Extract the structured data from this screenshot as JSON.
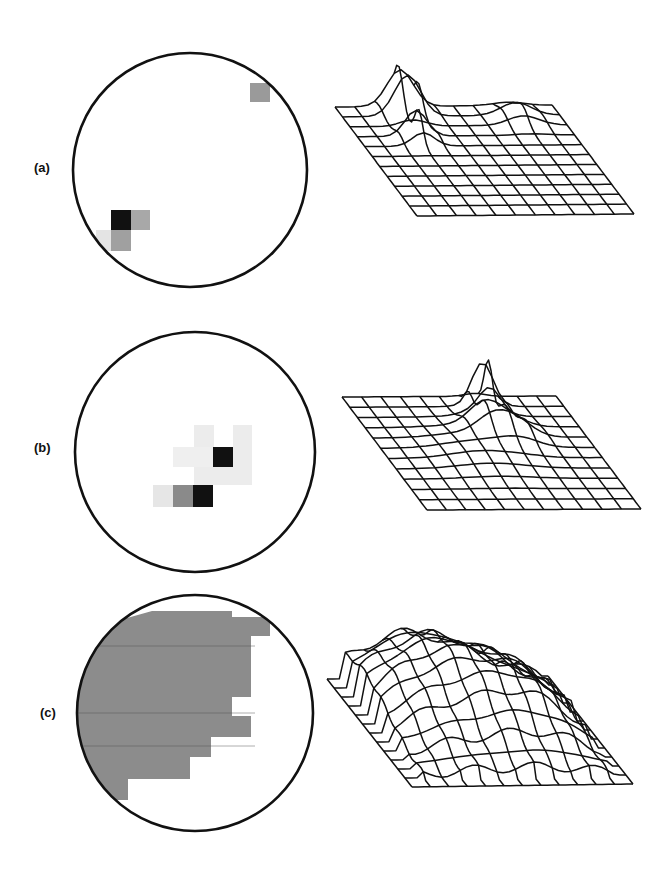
{
  "figure": {
    "panels": [
      {
        "id": "a",
        "label": "(a)",
        "pixel_map": {
          "shape": "circle",
          "cx": 190,
          "cy": 170,
          "r": 117,
          "cells": [
            {
              "x": 250,
              "y": 83,
              "w": 20,
              "h": 19,
              "color": "#9a9a9a"
            },
            {
              "x": 111,
              "y": 210,
              "w": 20,
              "h": 20,
              "color": "#111111"
            },
            {
              "x": 131,
              "y": 210,
              "w": 19,
              "h": 20,
              "color": "#a8a8a8"
            },
            {
              "x": 111,
              "y": 230,
              "w": 20,
              "h": 21,
              "color": "#a0a0a0"
            },
            {
              "x": 96,
              "y": 230,
              "w": 15,
              "h": 21,
              "color": "#e4e4e4"
            }
          ]
        },
        "surface": {
          "description": "flat grid with single sharp peak near left-back and small bump at right-back",
          "grid": {
            "tl": [
              335,
              107
            ],
            "tr": [
              552,
              105
            ],
            "bl": [
              417,
              216
            ],
            "br": [
              632,
              213
            ],
            "cols": 11,
            "rows": 11
          },
          "peaks": [
            {
              "u": 0.3,
              "v": 0.05,
              "height": 52,
              "width": 0.06
            },
            {
              "u": 0.27,
              "v": 0.3,
              "height": 30,
              "width": 0.05
            },
            {
              "u": 0.8,
              "v": 0.12,
              "height": 14,
              "width": 0.07
            }
          ]
        }
      },
      {
        "id": "b",
        "label": "(b)",
        "pixel_map": {
          "shape": "circle",
          "cx": 195,
          "cy": 452,
          "r": 120,
          "cells": [
            {
              "x": 194,
              "y": 425,
              "w": 20,
              "h": 22,
              "color": "#ececec"
            },
            {
              "x": 233,
              "y": 425,
              "w": 19,
              "h": 22,
              "color": "#ececec"
            },
            {
              "x": 173,
              "y": 447,
              "w": 40,
              "h": 20,
              "color": "#efefef"
            },
            {
              "x": 213,
              "y": 447,
              "w": 20,
              "h": 20,
              "color": "#111111"
            },
            {
              "x": 233,
              "y": 447,
              "w": 19,
              "h": 20,
              "color": "#ececec"
            },
            {
              "x": 194,
              "y": 467,
              "w": 58,
              "h": 18,
              "color": "#ececec"
            },
            {
              "x": 153,
              "y": 485,
              "w": 20,
              "h": 22,
              "color": "#e6e6e6"
            },
            {
              "x": 173,
              "y": 485,
              "w": 20,
              "h": 22,
              "color": "#8a8a8a"
            },
            {
              "x": 193,
              "y": 485,
              "w": 20,
              "h": 22,
              "color": "#111111"
            }
          ]
        },
        "surface": {
          "description": "grid with a tall central peak toward the right-back and low ridges around it",
          "grid": {
            "tl": [
              342,
              397
            ],
            "tr": [
              556,
              396
            ],
            "bl": [
              427,
              510
            ],
            "br": [
              638,
              507
            ],
            "cols": 11,
            "rows": 11
          },
          "peaks": [
            {
              "u": 0.62,
              "v": 0.12,
              "height": 52,
              "width": 0.05
            },
            {
              "u": 0.55,
              "v": 0.3,
              "height": 22,
              "width": 0.07
            },
            {
              "u": 0.66,
              "v": 0.35,
              "height": 18,
              "width": 0.08
            },
            {
              "u": 0.45,
              "v": 0.5,
              "height": 8,
              "width": 0.15
            }
          ]
        }
      },
      {
        "id": "c",
        "label": "(c)",
        "pixel_map": {
          "shape": "circle",
          "cx": 195,
          "cy": 713,
          "r": 118,
          "region_color": "#8c8c8c",
          "region_polygon": [
            [
              152,
              611
            ],
            [
              232,
              611
            ],
            [
              232,
              617
            ],
            [
              270,
              617
            ],
            [
              270,
              636
            ],
            [
              251,
              636
            ],
            [
              251,
              697
            ],
            [
              232,
              697
            ],
            [
              232,
              716
            ],
            [
              251,
              716
            ],
            [
              251,
              737
            ],
            [
              211,
              737
            ],
            [
              211,
              757
            ],
            [
              190,
              757
            ],
            [
              190,
              779
            ],
            [
              128,
              779
            ],
            [
              128,
              800
            ],
            [
              100,
              800
            ],
            [
              78,
              760
            ],
            [
              76,
              700
            ],
            [
              90,
              650
            ],
            [
              120,
              620
            ]
          ]
        },
        "surface": {
          "description": "broad hump over most of the grid, dropping off toward front-right",
          "grid": {
            "tl": [
              327,
              679
            ],
            "tr": [
              548,
              676
            ],
            "bl": [
              412,
              787
            ],
            "br": [
              627,
              784
            ],
            "cols": 12,
            "rows": 12
          },
          "hump": {
            "height": 60
          }
        }
      }
    ]
  }
}
